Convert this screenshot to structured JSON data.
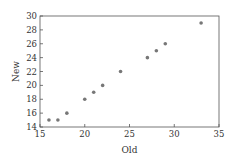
{
  "chart_data": {
    "type": "scatter",
    "title": "",
    "xlabel": "Old",
    "ylabel": "New",
    "xlim": [
      15,
      35
    ],
    "ylim": [
      14,
      30
    ],
    "xticks": [
      15,
      20,
      25,
      30,
      35
    ],
    "yticks": [
      14,
      16,
      18,
      20,
      22,
      24,
      26,
      28,
      30
    ],
    "grid": false,
    "legend": null,
    "series": [
      {
        "name": "data",
        "color": "#777777",
        "points": [
          {
            "x": 16,
            "y": 15
          },
          {
            "x": 17,
            "y": 15
          },
          {
            "x": 18,
            "y": 16
          },
          {
            "x": 20,
            "y": 18
          },
          {
            "x": 21,
            "y": 19
          },
          {
            "x": 22,
            "y": 20
          },
          {
            "x": 24,
            "y": 22
          },
          {
            "x": 27,
            "y": 24
          },
          {
            "x": 28,
            "y": 25
          },
          {
            "x": 29,
            "y": 26
          },
          {
            "x": 33,
            "y": 29
          }
        ]
      }
    ]
  }
}
